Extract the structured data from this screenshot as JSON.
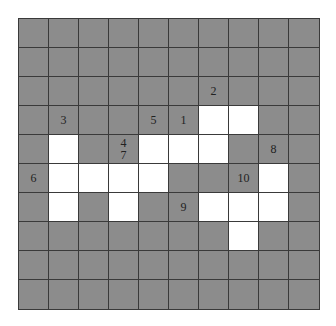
{
  "puzzle": {
    "rows": 10,
    "cols": 10,
    "colors": {
      "block": "#8c8c8c",
      "open": "#ffffff",
      "line": "#3a3a3a",
      "number": "#222222"
    },
    "open_cells": [
      [
        3,
        6
      ],
      [
        3,
        7
      ],
      [
        4,
        1
      ],
      [
        4,
        4
      ],
      [
        4,
        5
      ],
      [
        4,
        6
      ],
      [
        5,
        1
      ],
      [
        5,
        2
      ],
      [
        5,
        3
      ],
      [
        5,
        4
      ],
      [
        5,
        8
      ],
      [
        6,
        1
      ],
      [
        6,
        3
      ],
      [
        6,
        6
      ],
      [
        6,
        7
      ],
      [
        6,
        8
      ],
      [
        7,
        7
      ]
    ],
    "clue_numbers": [
      {
        "row": 2,
        "col": 6,
        "label": "2"
      },
      {
        "row": 3,
        "col": 1,
        "label": "3"
      },
      {
        "row": 3,
        "col": 4,
        "label": "5"
      },
      {
        "row": 3,
        "col": 5,
        "label": "1"
      },
      {
        "row": 4,
        "col": 3,
        "label": "4\n7"
      },
      {
        "row": 4,
        "col": 8,
        "label": "8"
      },
      {
        "row": 5,
        "col": 0,
        "label": "6"
      },
      {
        "row": 5,
        "col": 7,
        "label": "10"
      },
      {
        "row": 6,
        "col": 5,
        "label": "9"
      }
    ]
  }
}
